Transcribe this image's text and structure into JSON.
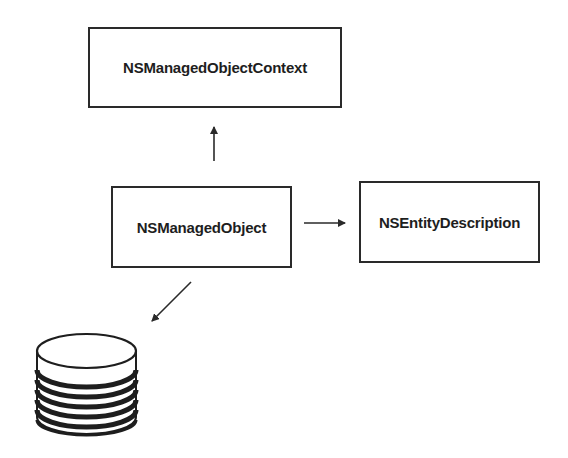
{
  "diagram": {
    "nodes": [
      {
        "id": "context",
        "label": "NSManagedObjectContext"
      },
      {
        "id": "object",
        "label": "NSManagedObject"
      },
      {
        "id": "entity",
        "label": "NSEntityDescription"
      },
      {
        "id": "store",
        "label": "",
        "shape": "database-cylinder"
      }
    ],
    "edges": [
      {
        "from": "object",
        "to": "context",
        "direction": "up"
      },
      {
        "from": "object",
        "to": "entity",
        "direction": "right"
      },
      {
        "from": "object",
        "to": "store",
        "direction": "down-left"
      }
    ],
    "colors": {
      "stroke": "#2a2a2a",
      "text": "#1e1e1e",
      "background": "#ffffff"
    }
  }
}
